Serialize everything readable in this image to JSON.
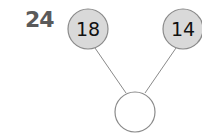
{
  "question": {
    "number": "24"
  },
  "number_bond": {
    "parts": [
      {
        "value": "18",
        "cx": 88,
        "cy": 29,
        "r": 20
      },
      {
        "value": "14",
        "cx": 183,
        "cy": 29,
        "r": 20
      }
    ],
    "whole": {
      "value": "",
      "cx": 135,
      "cy": 112,
      "r": 20
    },
    "colors": {
      "part_fill": "#d9d9d9",
      "stroke": "#8a8a8a",
      "whole_fill": "#ffffff",
      "text": "#111111",
      "question_number": "#5a5a5a"
    }
  }
}
